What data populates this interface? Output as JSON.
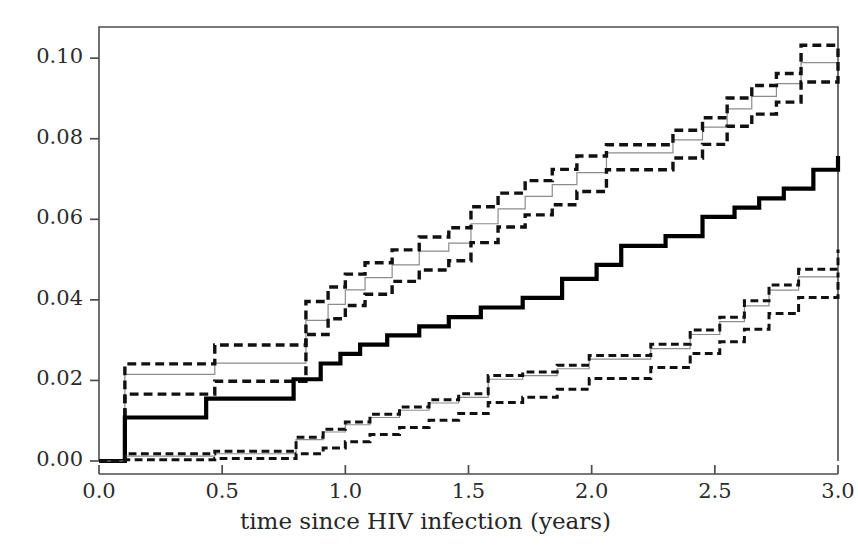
{
  "chart_data": {
    "type": "line",
    "subtype": "step-cumulative-incidence",
    "title": "",
    "xlabel": "time since HIV infection (years)",
    "ylabel": "",
    "xlim": [
      0.0,
      3.0
    ],
    "ylim": [
      0.0,
      0.106
    ],
    "xticks": [
      0.0,
      0.5,
      1.0,
      1.5,
      2.0,
      2.5,
      3.0
    ],
    "xticklabels": [
      "0.0",
      "0.5",
      "1.0",
      "1.5",
      "2.0",
      "2.5",
      "3.0"
    ],
    "yticks": [
      0.0,
      0.02,
      0.04,
      0.06,
      0.08,
      0.1
    ],
    "yticklabels": [
      "0.00",
      "0.02",
      "0.04",
      "0.06",
      "0.08",
      "0.10"
    ],
    "grid": false,
    "legend": "none",
    "step_mode": "post",
    "series": [
      {
        "name": "upper-group-estimate",
        "style": "thin-solid-gray",
        "color": "#8c8c8c",
        "width": 1.2,
        "x": [
          0.0,
          0.105,
          0.47,
          0.84,
          0.93,
          1.0,
          1.08,
          1.19,
          1.3,
          1.42,
          1.51,
          1.62,
          1.73,
          1.84,
          1.94,
          2.06,
          2.2,
          2.33,
          2.45,
          2.55,
          2.65,
          2.75,
          2.85,
          3.0
        ],
        "y": [
          0.0,
          0.0215,
          0.0243,
          0.0349,
          0.0389,
          0.0425,
          0.0455,
          0.0487,
          0.0521,
          0.0541,
          0.0589,
          0.0626,
          0.0657,
          0.0686,
          0.0716,
          0.0765,
          0.0765,
          0.0797,
          0.0829,
          0.0874,
          0.0905,
          0.0937,
          0.0989,
          0.1014
        ]
      },
      {
        "name": "upper-group-ci-upper",
        "style": "thick-dashed",
        "color": "#111111",
        "width": 3.4,
        "x": [
          0.0,
          0.105,
          0.47,
          0.84,
          0.93,
          1.0,
          1.08,
          1.19,
          1.3,
          1.42,
          1.51,
          1.62,
          1.73,
          1.84,
          1.94,
          2.06,
          2.2,
          2.33,
          2.45,
          2.55,
          2.65,
          2.75,
          2.85,
          3.0
        ],
        "y": [
          0.0,
          0.0241,
          0.0288,
          0.0396,
          0.0432,
          0.0464,
          0.0492,
          0.0524,
          0.0556,
          0.0579,
          0.0631,
          0.0665,
          0.0696,
          0.0724,
          0.0757,
          0.0785,
          0.0785,
          0.0821,
          0.0852,
          0.0901,
          0.0932,
          0.0962,
          0.1032,
          0.1032
        ]
      },
      {
        "name": "upper-group-ci-lower",
        "style": "thick-dashed",
        "color": "#111111",
        "width": 3.4,
        "x": [
          0.0,
          0.105,
          0.47,
          0.84,
          0.93,
          1.0,
          1.08,
          1.19,
          1.3,
          1.42,
          1.51,
          1.62,
          1.73,
          1.84,
          1.94,
          2.06,
          2.2,
          2.33,
          2.45,
          2.55,
          2.65,
          2.75,
          2.85,
          3.0
        ],
        "y": [
          0.0,
          0.0166,
          0.0198,
          0.0314,
          0.0353,
          0.0386,
          0.0414,
          0.0446,
          0.0474,
          0.0497,
          0.0542,
          0.0581,
          0.0611,
          0.0636,
          0.0669,
          0.0723,
          0.0723,
          0.0752,
          0.0786,
          0.0831,
          0.0861,
          0.0891,
          0.0941,
          0.1024
        ]
      },
      {
        "name": "middle-estimate",
        "style": "thick-solid",
        "color": "#000000",
        "width": 4.2,
        "x": [
          0.0,
          0.105,
          0.435,
          0.66,
          0.79,
          0.9,
          0.98,
          1.06,
          1.17,
          1.3,
          1.42,
          1.55,
          1.72,
          1.88,
          2.02,
          2.12,
          2.3,
          2.45,
          2.58,
          2.68,
          2.78,
          2.9,
          3.0
        ],
        "y": [
          0.0,
          0.0108,
          0.0155,
          0.0155,
          0.0203,
          0.0242,
          0.0266,
          0.0289,
          0.0312,
          0.0334,
          0.0357,
          0.0381,
          0.0405,
          0.0452,
          0.0487,
          0.0534,
          0.0558,
          0.0606,
          0.0629,
          0.0652,
          0.0676,
          0.0723,
          0.0757
        ]
      },
      {
        "name": "lower-group-estimate",
        "style": "thin-solid-gray",
        "color": "#8c8c8c",
        "width": 1.2,
        "x": [
          0.0,
          0.105,
          0.47,
          0.8,
          0.91,
          1.0,
          1.1,
          1.22,
          1.34,
          1.46,
          1.58,
          1.72,
          1.86,
          1.99,
          2.1,
          2.24,
          2.4,
          2.52,
          2.62,
          2.72,
          2.84,
          3.0
        ],
        "y": [
          0.0,
          0.0012,
          0.0018,
          0.0053,
          0.0072,
          0.009,
          0.0108,
          0.0126,
          0.0144,
          0.0158,
          0.0203,
          0.0212,
          0.0229,
          0.0253,
          0.0253,
          0.0279,
          0.0314,
          0.0346,
          0.0385,
          0.0424,
          0.0457,
          0.0492
        ]
      },
      {
        "name": "lower-group-ci-upper",
        "style": "thick-dashed",
        "color": "#111111",
        "width": 3.0,
        "x": [
          0.0,
          0.105,
          0.47,
          0.8,
          0.91,
          1.0,
          1.1,
          1.22,
          1.34,
          1.46,
          1.58,
          1.72,
          1.86,
          1.99,
          2.1,
          2.24,
          2.4,
          2.52,
          2.62,
          2.72,
          2.84,
          3.0
        ],
        "y": [
          0.0,
          0.0018,
          0.0024,
          0.0059,
          0.0079,
          0.0097,
          0.0116,
          0.0134,
          0.0152,
          0.0167,
          0.0212,
          0.0221,
          0.0238,
          0.0262,
          0.0262,
          0.029,
          0.0325,
          0.0357,
          0.0398,
          0.0437,
          0.0476,
          0.0525
        ]
      },
      {
        "name": "lower-group-ci-lower",
        "style": "thick-dashed",
        "color": "#111111",
        "width": 3.0,
        "x": [
          0.0,
          0.105,
          0.47,
          0.8,
          0.91,
          1.0,
          1.1,
          1.22,
          1.34,
          1.46,
          1.58,
          1.72,
          1.86,
          1.99,
          2.1,
          2.24,
          2.4,
          2.52,
          2.62,
          2.72,
          2.84,
          3.0
        ],
        "y": [
          0.0,
          0.0003,
          0.0006,
          0.0018,
          0.0032,
          0.0048,
          0.0066,
          0.0083,
          0.0101,
          0.0118,
          0.0145,
          0.0158,
          0.0178,
          0.0205,
          0.0205,
          0.0232,
          0.0267,
          0.0296,
          0.0327,
          0.0366,
          0.0406,
          0.0468
        ]
      }
    ]
  },
  "axes": {
    "frame_color": "#4d4d4d",
    "tick_color": "#4d4d4d",
    "background": "#ffffff"
  }
}
